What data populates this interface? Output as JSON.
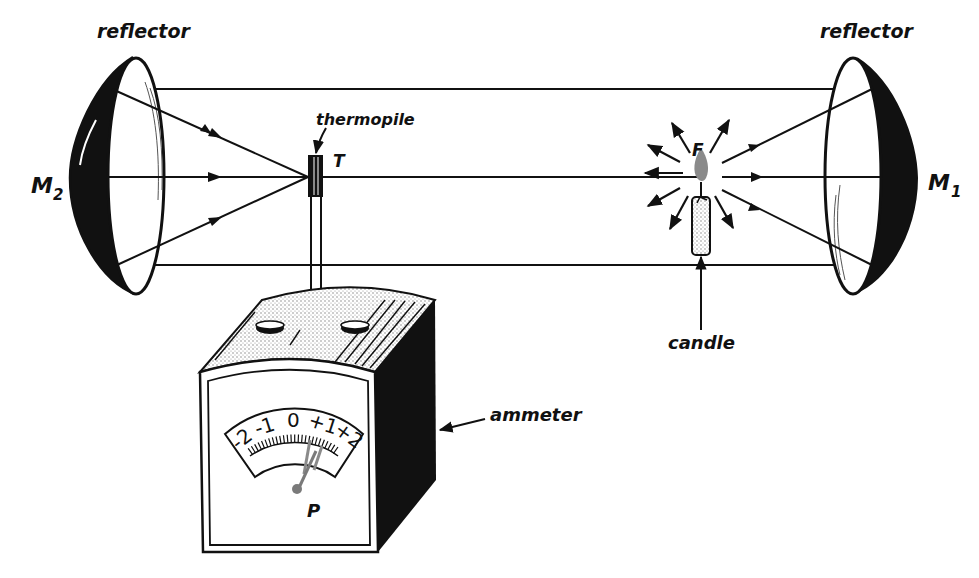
{
  "diagram": {
    "type": "experimental-apparatus",
    "labels": {
      "reflector_left": "reflector",
      "reflector_right": "reflector",
      "mirror_left": "M",
      "mirror_left_sub": "2",
      "mirror_right": "M",
      "mirror_right_sub": "1",
      "thermopile": "thermopile",
      "thermopile_symbol": "T",
      "flame_symbol": "F",
      "candle": "candle",
      "ammeter": "ammeter",
      "pointer_symbol": "P"
    },
    "dial": {
      "scale": [
        "-2",
        "-1",
        "0",
        "+1",
        "+2"
      ],
      "pointer_reading": "+1"
    },
    "colors": {
      "ink": "#111111",
      "flame": "#8a8a8a",
      "stipple": "#9a9a9a",
      "background": "#ffffff"
    }
  }
}
